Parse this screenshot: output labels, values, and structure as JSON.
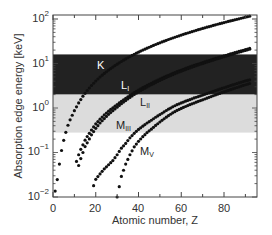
{
  "chart_data": {
    "type": "scatter",
    "title": "",
    "xlabel": "Atomic number, Z",
    "ylabel": "Absorption edge energy [keV]",
    "xlim": [
      0,
      95
    ],
    "ylim": [
      0.01,
      100
    ],
    "yscale": "log",
    "x_ticks": [
      0,
      20,
      40,
      60,
      80
    ],
    "y_ticks": [
      "10^-2",
      "10^-1",
      "10^0",
      "10^1",
      "10^2"
    ],
    "grid": false,
    "legend": "none (inline curve labels)",
    "bands": [
      {
        "name": "dark band",
        "ymin": 2.0,
        "ymax": 16.0,
        "color": "#222222"
      },
      {
        "name": "light band",
        "ymin": 0.28,
        "ymax": 2.0,
        "color": "#dcdcdc"
      }
    ],
    "series": [
      {
        "name": "K",
        "label_main": "K",
        "label_sub": "",
        "label_pos": {
          "x": 97,
          "y": 60
        },
        "label_color": "#ffffff",
        "z": [
          1,
          2,
          3,
          4,
          5,
          6,
          7,
          8,
          10,
          12,
          14,
          16,
          18,
          20,
          22,
          24,
          26,
          28,
          30,
          32,
          34,
          36,
          38,
          40,
          42,
          44,
          46,
          48,
          50,
          52,
          54,
          56,
          58,
          60,
          62,
          64,
          66,
          68,
          70,
          72,
          74,
          76,
          78,
          80,
          82,
          84,
          86,
          88,
          90,
          92
        ],
        "energy_keV": [
          0.0136,
          0.0246,
          0.055,
          0.111,
          0.188,
          0.284,
          0.41,
          0.543,
          0.87,
          1.3,
          1.84,
          2.47,
          3.2,
          4.04,
          4.97,
          5.99,
          7.11,
          8.33,
          9.66,
          11.1,
          12.66,
          14.3,
          16.1,
          18.0,
          20.0,
          22.1,
          24.35,
          26.7,
          29.2,
          31.8,
          34.6,
          37.4,
          40.4,
          43.6,
          46.8,
          50.2,
          53.8,
          57.5,
          61.3,
          65.35,
          69.5,
          73.9,
          78.4,
          83.1,
          88.0,
          93.1,
          98.4,
          103.9,
          109.7,
          115.6
        ]
      },
      {
        "name": "L_I",
        "label_main": "L",
        "label_sub": "I",
        "label_pos": {
          "x": 121,
          "y": 80
        },
        "label_color": "#ffffff",
        "z": [
          11,
          12,
          13,
          14,
          15,
          16,
          17,
          18,
          20,
          22,
          24,
          26,
          28,
          30,
          32,
          34,
          36,
          38,
          40,
          42,
          44,
          46,
          48,
          50,
          52,
          54,
          56,
          58,
          60,
          62,
          64,
          66,
          68,
          70,
          72,
          74,
          76,
          78,
          80,
          82,
          84,
          86,
          88,
          90,
          92
        ],
        "energy_keV": [
          0.063,
          0.089,
          0.118,
          0.149,
          0.189,
          0.229,
          0.27,
          0.32,
          0.44,
          0.56,
          0.7,
          0.85,
          1.01,
          1.2,
          1.41,
          1.65,
          1.92,
          2.22,
          2.53,
          2.87,
          3.22,
          3.6,
          4.02,
          4.47,
          4.94,
          5.45,
          5.99,
          6.55,
          7.13,
          7.74,
          8.38,
          9.05,
          9.75,
          10.49,
          11.27,
          12.1,
          12.97,
          13.88,
          14.84,
          15.86,
          16.94,
          18.05,
          19.24,
          20.47,
          21.76
        ]
      },
      {
        "name": "L_II",
        "label_main": "L",
        "label_sub": "II",
        "label_pos": {
          "x": 140,
          "y": 97
        },
        "label_color": "#222222",
        "z": [
          12,
          13,
          14,
          15,
          16,
          17,
          18,
          20,
          22,
          24,
          26,
          28,
          30,
          32,
          34,
          36,
          38,
          40,
          42,
          44,
          46,
          48,
          50,
          52,
          54,
          56,
          58,
          60,
          62,
          64,
          66,
          68,
          70,
          72,
          74,
          76,
          78,
          80,
          82,
          84,
          86,
          88,
          90,
          92
        ],
        "energy_keV": [
          0.051,
          0.073,
          0.1,
          0.136,
          0.165,
          0.202,
          0.25,
          0.35,
          0.46,
          0.58,
          0.72,
          0.87,
          1.04,
          1.25,
          1.47,
          1.73,
          2.01,
          2.31,
          2.63,
          2.97,
          3.33,
          3.73,
          4.16,
          4.61,
          5.1,
          5.62,
          6.16,
          6.72,
          7.31,
          7.93,
          8.58,
          9.26,
          9.98,
          10.74,
          11.54,
          12.39,
          13.27,
          14.21,
          15.2,
          16.24,
          17.34,
          18.48,
          19.69,
          20.95
        ]
      },
      {
        "name": "M_III",
        "label_main": "M",
        "label_sub": "III",
        "label_pos": {
          "x": 116,
          "y": 120
        },
        "label_color": "#222222",
        "z": [
          19,
          20,
          22,
          24,
          26,
          28,
          30,
          32,
          34,
          36,
          38,
          40,
          42,
          44,
          46,
          48,
          50,
          52,
          54,
          56,
          58,
          60,
          62,
          64,
          66,
          68,
          70,
          72,
          74,
          76,
          78,
          80,
          82,
          84,
          86,
          88,
          90,
          92
        ],
        "energy_keV": [
          0.018,
          0.025,
          0.033,
          0.043,
          0.053,
          0.066,
          0.089,
          0.125,
          0.16,
          0.214,
          0.27,
          0.33,
          0.39,
          0.46,
          0.53,
          0.62,
          0.71,
          0.82,
          0.94,
          1.06,
          1.19,
          1.3,
          1.42,
          1.54,
          1.68,
          1.81,
          1.95,
          2.11,
          2.28,
          2.46,
          2.65,
          2.85,
          3.07,
          3.3,
          3.54,
          3.79,
          4.05,
          4.3
        ]
      },
      {
        "name": "M_V",
        "label_main": "M",
        "label_sub": "V",
        "label_pos": {
          "x": 140,
          "y": 146
        },
        "label_color": "#222222",
        "z": [
          30,
          32,
          34,
          36,
          38,
          40,
          42,
          44,
          46,
          48,
          50,
          52,
          54,
          56,
          58,
          60,
          62,
          64,
          66,
          68,
          70,
          72,
          74,
          76,
          78,
          80,
          82,
          84,
          86,
          88,
          90,
          92
        ],
        "energy_keV": [
          0.01,
          0.029,
          0.055,
          0.089,
          0.134,
          0.178,
          0.227,
          0.28,
          0.335,
          0.405,
          0.485,
          0.573,
          0.672,
          0.78,
          0.88,
          0.98,
          1.08,
          1.19,
          1.29,
          1.41,
          1.53,
          1.66,
          1.81,
          1.96,
          2.12,
          2.3,
          2.48,
          2.68,
          2.89,
          3.11,
          3.33,
          3.55
        ]
      }
    ]
  },
  "axes": {
    "xlabel": "Atomic number, Z",
    "ylabel": "Absorption edge energy [keV]",
    "x_tick_labels": [
      "0",
      "20",
      "40",
      "60",
      "80"
    ],
    "y_tick_labels": [
      {
        "base": "10",
        "exp": "2"
      },
      {
        "base": "10",
        "exp": "1"
      },
      {
        "base": "10",
        "exp": "0"
      },
      {
        "base": "10",
        "exp": "−1"
      },
      {
        "base": "10",
        "exp": "−2"
      }
    ]
  }
}
